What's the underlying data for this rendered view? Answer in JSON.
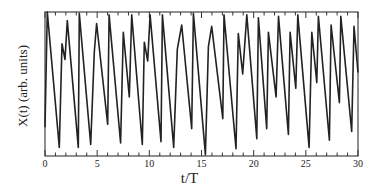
{
  "chart_data": {
    "type": "line",
    "title": "",
    "xlabel": "t/T",
    "ylabel": "X(t) (arb. units)",
    "xlim": [
      0,
      30
    ],
    "ylim": [
      0,
      1
    ],
    "xticks_major": [
      0,
      5,
      10,
      15,
      20,
      25,
      30
    ],
    "xtick_labels": [
      "0",
      "5",
      "10",
      "15",
      "20",
      "25",
      "30"
    ],
    "xticks_minor_step": 1,
    "yticks": [],
    "grid": false,
    "legend": null,
    "series": [
      {
        "name": "X(t)",
        "color": "#222222",
        "x": [
          0.0,
          0.22,
          1.37,
          1.63,
          1.92,
          2.14,
          3.19,
          3.29,
          4.38,
          4.73,
          4.95,
          6.01,
          6.14,
          7.25,
          7.5,
          8.08,
          8.31,
          9.33,
          9.52,
          9.84,
          10.07,
          11.12,
          11.25,
          12.34,
          12.68,
          13.1,
          14.06,
          14.22,
          15.37,
          15.66,
          15.98,
          17.04,
          17.16,
          18.31,
          18.53,
          18.95,
          19.34,
          20.3,
          20.45,
          21.25,
          21.41,
          22.15,
          22.38,
          23.33,
          23.49,
          24.04,
          24.23,
          25.31,
          25.57,
          26.05,
          26.2,
          27.26,
          27.42,
          28.22,
          28.35,
          29.4,
          29.62,
          30.0
        ],
        "y": [
          0.2,
          1.0,
          0.06,
          0.78,
          0.67,
          0.94,
          0.06,
          0.99,
          0.08,
          0.72,
          0.92,
          0.22,
          0.98,
          0.09,
          0.86,
          0.41,
          0.98,
          0.08,
          0.79,
          0.66,
          0.98,
          0.1,
          0.98,
          0.06,
          0.74,
          0.91,
          0.19,
          0.99,
          0.01,
          0.76,
          0.9,
          0.26,
          0.98,
          0.05,
          0.85,
          0.57,
          0.98,
          0.12,
          0.96,
          0.19,
          0.86,
          0.41,
          0.97,
          0.15,
          0.86,
          0.47,
          0.98,
          0.06,
          0.86,
          0.51,
          0.97,
          0.11,
          0.91,
          0.37,
          0.97,
          0.17,
          0.9,
          0.58
        ]
      }
    ]
  },
  "axes": {
    "xlabel": "t/T",
    "ylabel": "X(t) (arb. units)"
  }
}
